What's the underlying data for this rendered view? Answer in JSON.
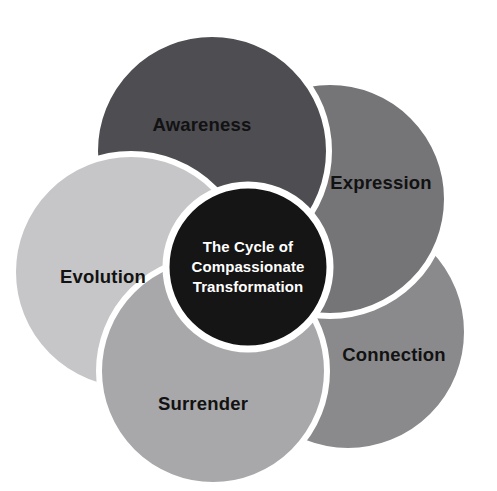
{
  "diagram": {
    "title": "The Cycle of Compassionate Transformation",
    "type": "venn-petal-cycle",
    "background_color": "#ffffff",
    "stroke_color": "#ffffff",
    "center": {
      "lines": [
        "The Cycle of",
        "Compassionate",
        "Transformation"
      ],
      "fill_color": "#151515",
      "text_color": "#ffffff"
    },
    "petals": [
      {
        "label": "Awareness",
        "fill_color": "#4d4d52",
        "text_color": "#121212",
        "position": "top"
      },
      {
        "label": "Expression",
        "fill_color": "#757578",
        "text_color": "#121212",
        "position": "top-right"
      },
      {
        "label": "Connection",
        "fill_color": "#8a8a8d",
        "text_color": "#121212",
        "position": "bottom-right"
      },
      {
        "label": "Surrender",
        "fill_color": "#a8a8ab",
        "text_color": "#121212",
        "position": "bottom-left"
      },
      {
        "label": "Evolution",
        "fill_color": "#c6c6c8",
        "text_color": "#121212",
        "position": "left"
      }
    ]
  }
}
